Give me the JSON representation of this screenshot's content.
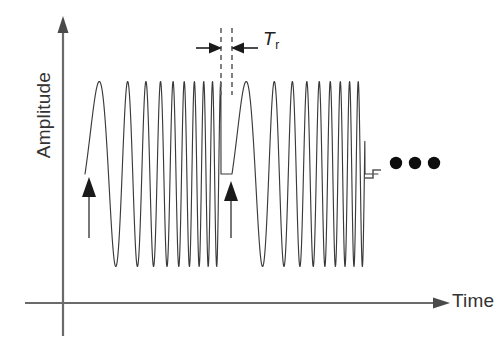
{
  "figure": {
    "title": "",
    "background_color": "#ffffff",
    "width": 503,
    "height": 342
  },
  "axes": {
    "y_label": "Amplitude",
    "x_label": "Time",
    "origin": {
      "x": 63,
      "y": 303
    },
    "y_axis_top": 20,
    "x_axis_right": 445,
    "arrowheads": true,
    "line_color": "#6a6a6a"
  },
  "annotations": {
    "interval_label_main": "T",
    "interval_label_sub": "r",
    "interval_label_full": "Tr",
    "ellipsis": "•••",
    "dashed_line_1_x": 221,
    "dashed_line_2_x": 232,
    "start_marker_1_x": 89,
    "start_marker_2_x": 231,
    "marker_color": "#1a1a1a"
  },
  "chart_data": {
    "type": "line",
    "title": "",
    "xlabel": "Time",
    "ylabel": "Amplitude",
    "signal": "repeating linear frequency chirp (sawtooth FMCW sweep) with reset dead-time",
    "grid": false,
    "legend": false,
    "xlim": [
      0,
      1
    ],
    "ylim": [
      -1,
      1
    ],
    "axis_ticks": "none",
    "baseline_y": 174,
    "peak_y": 82,
    "trough_y": 267,
    "amplitude_normalized": 1.0,
    "sweeps": [
      {
        "name": "sweep-1",
        "x_start": 85,
        "x_end": 221,
        "f_start_cycles_per_px": 0.0115,
        "f_end_cycles_per_px": 0.125,
        "cycles": 15,
        "dead_time_x_start": 221,
        "dead_time_x_end": 232
      },
      {
        "name": "sweep-2",
        "x_start": 232,
        "x_end": 365,
        "f_start_cycles_per_px": 0.0115,
        "f_end_cycles_per_px": 0.125,
        "cycles": 15,
        "dead_time_x_start": 365,
        "dead_time_x_end": 378
      }
    ],
    "series": [
      {
        "name": "chirp-waveform",
        "color": "#3a3a3a",
        "description": "Amplitude versus time of a periodic up-chirp: frequency rises linearly from low to high across each sweep, then resets to the starting frequency after a short reset interval Tr."
      }
    ],
    "annotations": [
      {
        "name": "reset-interval",
        "label": "Tr",
        "x_from": 221,
        "x_to": 232,
        "description": "reset / retrace time between consecutive frequency sweeps"
      },
      {
        "name": "sweep-start-arrow-1",
        "x": 89,
        "description": "marks beginning of first sweep"
      },
      {
        "name": "sweep-start-arrow-2",
        "x": 231,
        "description": "marks beginning of second sweep"
      },
      {
        "name": "continuation-ellipsis",
        "x": 405,
        "description": "pattern repeats indefinitely"
      }
    ]
  }
}
